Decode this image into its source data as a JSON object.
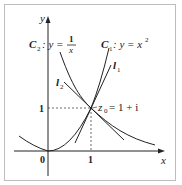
{
  "figure": {
    "axes": {
      "x_label": "x",
      "y_label": "y",
      "origin_label": "0",
      "x_tick_label": "1",
      "y_tick_label": "1"
    },
    "curves": {
      "c1": {
        "name": "C",
        "sub": "1",
        "eq_lhs": ": y = x",
        "eq_sup": "2"
      },
      "c2": {
        "name": "C",
        "sub": "2",
        "eq_lhs": ": y =",
        "frac_num": "1",
        "frac_den": "x"
      }
    },
    "tangents": {
      "l1": {
        "name": "l",
        "sub": "1"
      },
      "l2": {
        "name": "l",
        "sub": "2"
      }
    },
    "point": {
      "name": "z",
      "sub": "0",
      "value": "= 1 + i"
    },
    "colors": {
      "curve": "#222222",
      "frame": "#bdbdbd"
    }
  }
}
